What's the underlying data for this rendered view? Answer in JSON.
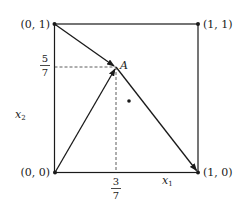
{
  "diagram": {
    "type": "geometry",
    "corners": [
      {
        "label": "(0, 1)",
        "x": 0,
        "y": 1
      },
      {
        "label": "(1, 1)",
        "x": 1,
        "y": 1
      },
      {
        "label": "(0, 0)",
        "x": 0,
        "y": 0
      },
      {
        "label": "(1, 0)",
        "x": 1,
        "y": 0
      }
    ],
    "point_a": {
      "label": "A",
      "x": "3/7",
      "y": "5/7"
    },
    "extra_point": {
      "label": "",
      "description": "unlabeled dot below-right of A"
    },
    "ticks": {
      "x_tick": {
        "numerator": "3",
        "denominator": "7"
      },
      "y_tick": {
        "numerator": "5",
        "denominator": "7"
      }
    },
    "axes": {
      "x_label": "x",
      "x_sub": "1",
      "y_label": "x",
      "y_sub": "2"
    },
    "arrows": [
      {
        "from": "(0, 1)",
        "to": "A"
      },
      {
        "from": "(0, 0)",
        "to": "A"
      },
      {
        "from": "A",
        "to": "(1, 0)"
      }
    ],
    "colors": {
      "stroke": "#1a1a1a",
      "background": "#ffffff"
    }
  }
}
